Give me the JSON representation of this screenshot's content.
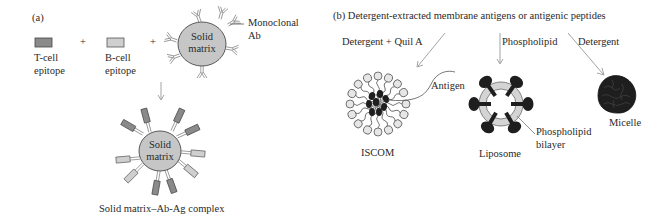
{
  "panel_a": {
    "label": "(a)",
    "t_cell": {
      "line1": "T-cell",
      "line2": "epitope",
      "color": "#8a8a8a"
    },
    "plus1": "+",
    "b_cell": {
      "line1": "B-cell",
      "line2": "epitope",
      "color": "#cfcfcf"
    },
    "plus2": "+",
    "matrix_top": {
      "line1": "Solid",
      "line2": "matrix",
      "color": "#c6c6c6"
    },
    "monoclonal": {
      "line1": "Monoclonal",
      "line2": "Ab"
    },
    "matrix_bottom": {
      "line1": "Solid",
      "line2": "matrix"
    },
    "complex_caption": "Solid matrix–Ab-Ag complex"
  },
  "panel_b": {
    "title": "(b)  Detergent-extracted membrane antigens or antigenic peptides",
    "routes": {
      "quil": "Detergent + Quil A",
      "phospholipid": "Phospholipid",
      "detergent": "Detergent"
    },
    "antigen_label": "Antigen",
    "iscom_caption": "ISCOM",
    "liposome_caption": "Liposome",
    "bilayer": {
      "line1": "Phospholipid",
      "line2": "bilayer"
    },
    "micelle_caption": "Micelle",
    "colors": {
      "antigen": "#1e1e1e",
      "bilayer": "#d4d4d4",
      "head": "#e6e6e6"
    }
  }
}
